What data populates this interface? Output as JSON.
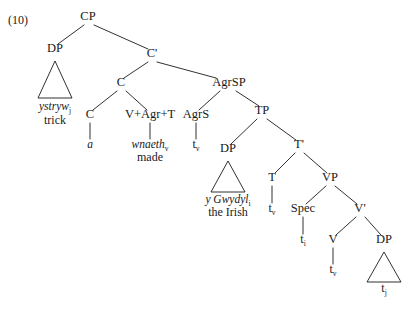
{
  "figure": {
    "example_number": "(10)",
    "language": "Welsh",
    "ink_color": "#1a1a1a",
    "background_color": "#ffffff"
  },
  "nodes": {
    "cp": {
      "label": "CP",
      "x": 88,
      "y": 20
    },
    "dp_topic": {
      "label": "DP",
      "x": 55,
      "y": 52
    },
    "cbar": {
      "label": "C'",
      "x": 152,
      "y": 57
    },
    "c_upper": {
      "label": "C",
      "x": 121,
      "y": 86
    },
    "agrsp": {
      "label": "AgrSP",
      "x": 229,
      "y": 86
    },
    "c_lower": {
      "label": "C",
      "x": 90,
      "y": 118
    },
    "vagrt": {
      "label": "V+Agr+T",
      "x": 150,
      "y": 118
    },
    "agrs": {
      "label": "AgrS",
      "x": 196,
      "y": 118
    },
    "tp": {
      "label": "TP",
      "x": 262,
      "y": 114
    },
    "dp_subj": {
      "label": "DP",
      "x": 228,
      "y": 152
    },
    "tbar": {
      "label": "T'",
      "x": 299,
      "y": 148
    },
    "t_head": {
      "label": "T",
      "x": 272,
      "y": 181
    },
    "vp": {
      "label": "VP",
      "x": 330,
      "y": 181
    },
    "spec": {
      "label": "Spec",
      "x": 303,
      "y": 212
    },
    "vbar": {
      "label": "V'",
      "x": 360,
      "y": 212
    },
    "v_head": {
      "label": "V",
      "x": 333,
      "y": 243
    },
    "dp_obj": {
      "label": "DP",
      "x": 384,
      "y": 243
    }
  },
  "leaves": {
    "topic_welsh": {
      "text": "ystryw",
      "subscript": "j",
      "x": 55,
      "y": 110,
      "italic": true
    },
    "topic_gloss": {
      "text": "trick",
      "subscript": "",
      "x": 55,
      "y": 124,
      "italic": false
    },
    "c_lower_item": {
      "text": "a",
      "subscript": "",
      "x": 90,
      "y": 148,
      "italic": true
    },
    "vagrt_item": {
      "text": "wnaeth",
      "subscript": "v",
      "x": 150,
      "y": 148,
      "italic": true
    },
    "vagrt_gloss": {
      "text": "made",
      "subscript": "",
      "x": 150,
      "y": 161,
      "italic": false
    },
    "subj_welsh": {
      "text": "y Gwydyl",
      "subscript": "i",
      "x": 228,
      "y": 203,
      "italic": true
    },
    "subj_gloss": {
      "text": "the Irish",
      "subscript": "",
      "x": 228,
      "y": 216,
      "italic": false
    }
  },
  "traces": {
    "agrs_trace": {
      "text": "t",
      "subscript": "v",
      "x": 196,
      "y": 148
    },
    "t_trace": {
      "text": "t",
      "subscript": "v",
      "x": 272,
      "y": 212
    },
    "spec_trace": {
      "text": "t",
      "subscript": "i",
      "x": 303,
      "y": 243
    },
    "v_trace": {
      "text": "t",
      "subscript": "v",
      "x": 333,
      "y": 273
    },
    "obj_trace": {
      "text": "t",
      "subscript": "j",
      "x": 384,
      "y": 292
    }
  },
  "triangles": {
    "topic_triangle": {
      "apex_x": 55,
      "apex_y": 61,
      "left_x": 38,
      "right_x": 72,
      "base_y": 98
    },
    "subj_triangle": {
      "apex_x": 228,
      "apex_y": 161,
      "left_x": 211,
      "right_x": 245,
      "base_y": 192
    },
    "obj_triangle": {
      "apex_x": 384,
      "apex_y": 252,
      "left_x": 367,
      "right_x": 401,
      "base_y": 282
    }
  },
  "branches": [
    {
      "name": "cp-to-dp",
      "x1": 84,
      "y1": 25,
      "x2": 58,
      "y2": 44
    },
    {
      "name": "cp-to-cbar",
      "x1": 94,
      "y1": 25,
      "x2": 148,
      "y2": 49
    },
    {
      "name": "cbar-to-c",
      "x1": 148,
      "y1": 62,
      "x2": 124,
      "y2": 78
    },
    {
      "name": "cbar-to-agrsp",
      "x1": 157,
      "y1": 62,
      "x2": 216,
      "y2": 78
    },
    {
      "name": "c-to-clower",
      "x1": 117,
      "y1": 91,
      "x2": 93,
      "y2": 110
    },
    {
      "name": "c-to-vagrt",
      "x1": 126,
      "y1": 91,
      "x2": 147,
      "y2": 110
    },
    {
      "name": "agrsp-to-agrs",
      "x1": 220,
      "y1": 91,
      "x2": 199,
      "y2": 110
    },
    {
      "name": "agrsp-to-tp",
      "x1": 236,
      "y1": 91,
      "x2": 259,
      "y2": 106
    },
    {
      "name": "tp-to-dpsubj",
      "x1": 257,
      "y1": 119,
      "x2": 231,
      "y2": 144
    },
    {
      "name": "tp-to-tbar",
      "x1": 267,
      "y1": 119,
      "x2": 296,
      "y2": 140
    },
    {
      "name": "tbar-to-t",
      "x1": 295,
      "y1": 153,
      "x2": 275,
      "y2": 173
    },
    {
      "name": "tbar-to-vp",
      "x1": 304,
      "y1": 153,
      "x2": 327,
      "y2": 173
    },
    {
      "name": "vp-to-spec",
      "x1": 326,
      "y1": 186,
      "x2": 306,
      "y2": 204
    },
    {
      "name": "vp-to-vbar",
      "x1": 335,
      "y1": 186,
      "x2": 357,
      "y2": 204
    },
    {
      "name": "vbar-to-v",
      "x1": 356,
      "y1": 217,
      "x2": 336,
      "y2": 235
    },
    {
      "name": "vbar-to-dpobj",
      "x1": 365,
      "y1": 217,
      "x2": 381,
      "y2": 235
    },
    {
      "name": "clower-stem",
      "x1": 90,
      "y1": 123,
      "x2": 90,
      "y2": 139
    },
    {
      "name": "vagrt-stem",
      "x1": 150,
      "y1": 123,
      "x2": 150,
      "y2": 139
    },
    {
      "name": "agrs-stem",
      "x1": 196,
      "y1": 123,
      "x2": 196,
      "y2": 139
    },
    {
      "name": "t-stem",
      "x1": 272,
      "y1": 186,
      "x2": 272,
      "y2": 203
    },
    {
      "name": "spec-stem",
      "x1": 303,
      "y1": 217,
      "x2": 303,
      "y2": 234
    },
    {
      "name": "v-stem",
      "x1": 333,
      "y1": 248,
      "x2": 333,
      "y2": 264
    }
  ]
}
